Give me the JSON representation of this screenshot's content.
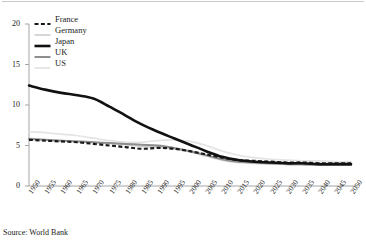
{
  "source_note": "Source: World Bank",
  "legend": {
    "position": "top-left",
    "items": [
      {
        "label": "France",
        "style": "dashed-black",
        "color": "#1a1a1a",
        "width": 2.2,
        "dash": "4,2.4"
      },
      {
        "label": "Germany",
        "style": "solid-light-gray",
        "color": "#cfcfcf",
        "width": 1.7,
        "dash": ""
      },
      {
        "label": "Japan",
        "style": "solid-thick-black",
        "color": "#111111",
        "width": 2.6,
        "dash": ""
      },
      {
        "label": "UK",
        "style": "solid-mid-gray",
        "color": "#8e8e8e",
        "width": 2.0,
        "dash": ""
      },
      {
        "label": "US",
        "style": "solid-pale-gray",
        "color": "#e4e4e4",
        "width": 1.7,
        "dash": ""
      }
    ]
  },
  "chart_data": {
    "type": "line",
    "title": "",
    "xlabel": "",
    "ylabel": "",
    "ylim": [
      0,
      20
    ],
    "yticks": [
      0,
      5,
      10,
      15,
      20
    ],
    "ytick_labels": [
      "0",
      "5",
      "10",
      "15",
      "20"
    ],
    "grid": false,
    "legend_position": "top-left",
    "x": [
      1950,
      1955,
      1960,
      1965,
      1970,
      1975,
      1980,
      1985,
      1990,
      1995,
      2000,
      2005,
      2010,
      2015,
      2020,
      2025,
      2030,
      2035,
      2040,
      2045,
      2050
    ],
    "xtick_labels": [
      "1950",
      "1955",
      "1960",
      "1965",
      "1970",
      "1975",
      "1980",
      "1985",
      "1990",
      "1995",
      "2000",
      "2005",
      "2010",
      "2015",
      "2020",
      "2025",
      "2030",
      "2035",
      "2040",
      "2045",
      "2050"
    ],
    "series": [
      {
        "name": "France",
        "values": [
          5.7,
          5.6,
          5.5,
          5.4,
          5.2,
          5.0,
          4.8,
          4.6,
          4.7,
          4.6,
          4.3,
          3.9,
          3.5,
          3.2,
          3.1,
          3.0,
          2.9,
          2.9,
          2.8,
          2.8,
          2.8
        ]
      },
      {
        "name": "Germany",
        "values": [
          5.9,
          5.7,
          5.6,
          5.5,
          5.4,
          5.3,
          5.1,
          4.9,
          4.8,
          4.6,
          4.2,
          3.7,
          3.2,
          2.9,
          2.8,
          2.7,
          2.7,
          2.6,
          2.6,
          2.6,
          2.6
        ]
      },
      {
        "name": "Japan",
        "values": [
          12.4,
          11.9,
          11.5,
          11.2,
          10.8,
          9.8,
          8.7,
          7.6,
          6.7,
          5.9,
          5.1,
          4.3,
          3.6,
          3.2,
          3.0,
          2.9,
          2.8,
          2.8,
          2.7,
          2.7,
          2.7
        ]
      },
      {
        "name": "UK",
        "values": [
          5.8,
          5.7,
          5.6,
          5.5,
          5.4,
          5.3,
          5.2,
          5.1,
          5.0,
          4.7,
          4.3,
          3.8,
          3.3,
          3.0,
          2.9,
          2.8,
          2.7,
          2.7,
          2.6,
          2.6,
          2.6
        ]
      },
      {
        "name": "US",
        "values": [
          6.7,
          6.6,
          6.4,
          6.2,
          5.9,
          5.6,
          5.4,
          5.4,
          5.6,
          5.7,
          5.5,
          5.0,
          4.3,
          3.8,
          3.5,
          3.3,
          3.2,
          3.1,
          3.1,
          3.0,
          3.0
        ]
      }
    ]
  }
}
